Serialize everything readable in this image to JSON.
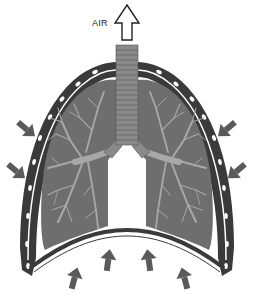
{
  "diagram": {
    "type": "lungs-exhalation",
    "labels": {
      "air": "AIR"
    },
    "colors": {
      "lung_fill": "#6e6e6e",
      "ribcage": "#3a3a3a",
      "pleura": "#ffffff",
      "bronchi": "#a8a8a8",
      "trachea": "#8a8a8a",
      "arrow": "#5a5a5a",
      "background": "#ffffff"
    },
    "arrows": {
      "air_out": "up",
      "side_left": 2,
      "side_right": 2,
      "diaphragm_up": 4
    }
  }
}
